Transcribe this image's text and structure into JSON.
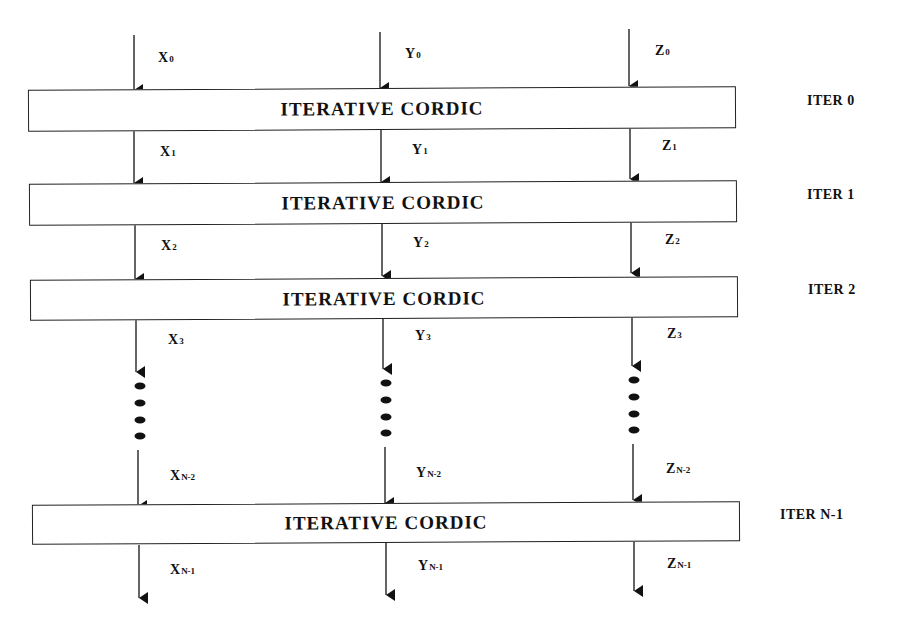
{
  "diagram": {
    "type": "iterative CORDIC unrolled pipeline",
    "columns": [
      {
        "name": "X",
        "x": 135
      },
      {
        "name": "Y",
        "x": 380
      },
      {
        "name": "Z",
        "x": 630
      }
    ],
    "blocks": [
      {
        "label": "ITERATIVE CORDIC",
        "iter_label": "ITER 0"
      },
      {
        "label": "ITERATIVE CORDIC",
        "iter_label": "ITER 1"
      },
      {
        "label": "ITERATIVE CORDIC",
        "iter_label": "ITER 2"
      },
      {
        "label": "ITERATIVE CORDIC",
        "iter_label": "ITER N-1"
      }
    ],
    "signals": {
      "stage0": [
        {
          "base": "X",
          "sub": "0"
        },
        {
          "base": "Y",
          "sub": "0"
        },
        {
          "base": "Z",
          "sub": "0"
        }
      ],
      "stage1": [
        {
          "base": "X",
          "sub": "1"
        },
        {
          "base": "Y",
          "sub": "1"
        },
        {
          "base": "Z",
          "sub": "1"
        }
      ],
      "stage2": [
        {
          "base": "X",
          "sub": "2"
        },
        {
          "base": "Y",
          "sub": "2"
        },
        {
          "base": "Z",
          "sub": "2"
        }
      ],
      "stage3": [
        {
          "base": "X",
          "sub": "3"
        },
        {
          "base": "Y",
          "sub": "3"
        },
        {
          "base": "Z",
          "sub": "3"
        }
      ],
      "stageN2": [
        {
          "base": "X",
          "sub": "N-2"
        },
        {
          "base": "Y",
          "sub": "N-2"
        },
        {
          "base": "Z",
          "sub": "N-2"
        }
      ],
      "stageN1": [
        {
          "base": "X",
          "sub": "N-1"
        },
        {
          "base": "Y",
          "sub": "N-1"
        },
        {
          "base": "Z",
          "sub": "N-1"
        }
      ]
    },
    "ellipsis_dots_per_column": 4,
    "colors": {
      "line": "#111111",
      "background": "#ffffff"
    }
  }
}
